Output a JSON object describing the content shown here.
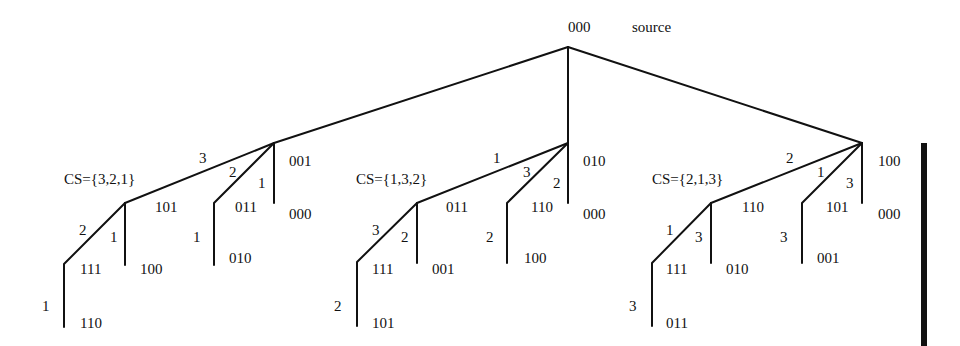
{
  "root": {
    "label": "000",
    "note": "source"
  },
  "subtrees": [
    {
      "cs": "CS={3,2,1}",
      "root_edges": {
        "to_main": "3",
        "to_second": "2",
        "to_third": "1"
      },
      "children": {
        "main": "101",
        "second": "011",
        "third_top": "001",
        "third_bottom": "000"
      },
      "level2": {
        "main_left_edge": "2",
        "main_right_edge": "1",
        "main_left": "111",
        "main_right": "100",
        "second_edge": "1",
        "second_leaf": "010"
      },
      "level3": {
        "edge": "1",
        "leaf": "110"
      }
    },
    {
      "cs": "CS={1,3,2}",
      "root_edges": {
        "to_main": "1",
        "to_second": "3",
        "to_third": "2"
      },
      "children": {
        "main": "011",
        "second": "110",
        "third_top": "010",
        "third_bottom": "000"
      },
      "level2": {
        "main_left_edge": "3",
        "main_right_edge": "2",
        "main_left": "111",
        "main_right": "001",
        "second_edge": "2",
        "second_leaf": "100"
      },
      "level3": {
        "edge": "2",
        "leaf": "101"
      }
    },
    {
      "cs": "CS={2,1,3}",
      "root_edges": {
        "to_main": "2",
        "to_second": "1",
        "to_third": "3"
      },
      "children": {
        "main": "110",
        "second": "101",
        "third_top": "100",
        "third_bottom": "000"
      },
      "level2": {
        "main_left_edge": "1",
        "main_right_edge": "3",
        "main_left": "111",
        "main_right": "010",
        "second_edge": "3",
        "second_leaf": "001"
      },
      "level3": {
        "edge": "3",
        "leaf": "011"
      }
    }
  ]
}
